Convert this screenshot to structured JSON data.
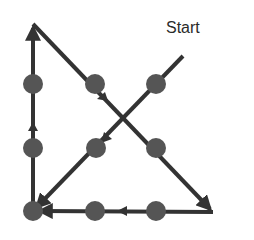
{
  "diagram": {
    "type": "nine-dots-puzzle-solution",
    "start_label": "Start",
    "colors": {
      "line": "#333333",
      "dot": "#555555",
      "background": "#ffffff"
    },
    "dots": [
      {
        "row": 1,
        "col": 1
      },
      {
        "row": 1,
        "col": 2
      },
      {
        "row": 1,
        "col": 3
      },
      {
        "row": 2,
        "col": 1
      },
      {
        "row": 2,
        "col": 2
      },
      {
        "row": 2,
        "col": 3
      },
      {
        "row": 3,
        "col": 1
      },
      {
        "row": 3,
        "col": 2
      },
      {
        "row": 3,
        "col": 3
      }
    ],
    "path_segments": [
      {
        "from": "start",
        "to": "bottom-left",
        "direction": "down-left"
      },
      {
        "from": "bottom-left",
        "to": "top-left-extended",
        "direction": "up"
      },
      {
        "from": "top-left-extended",
        "to": "bottom-right-extended",
        "direction": "down-right"
      },
      {
        "from": "bottom-right-extended",
        "to": "bottom-left",
        "direction": "left"
      }
    ]
  }
}
